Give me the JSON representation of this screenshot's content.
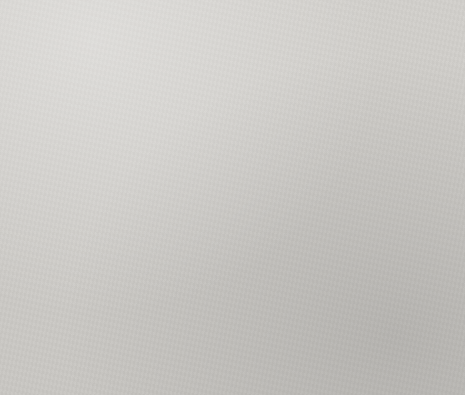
{
  "page": {
    "background": "#cfcdc9",
    "layout": "2x2 grid of pie charts on a scanned grey page"
  },
  "palette": {
    "slice1": "#6e6e6e",
    "slice2": "#4a4a4a",
    "slice3": "#8f8f8f",
    "slice4": "#b9b9b9",
    "slice5": "#d6d6d6",
    "separator": "#dddbd6",
    "text": "#1f1f1f"
  },
  "charts": [
    {
      "id": "alejandro-guillier",
      "title": "Origin of messages of Alejandro Guillier",
      "subtitle": "From 2017-09-15 17:00:00 to 2017-09-15 22:59:59",
      "chart_data": {
        "type": "pie",
        "title": "Origin of messages of Alejandro Guillier",
        "subtitle": "From 2017-09-15 17:00:00 to 2017-09-15 22:59:59",
        "categories": [
          "Twitter for Android",
          "Twitter for iPhone",
          "Twitter Web Client",
          "Facebook",
          "Top Ranking App User Cl."
        ],
        "values": [
          38,
          20,
          4,
          4,
          4
        ],
        "percents": [
          "54.3%",
          "28.6%",
          "5.71%",
          "5.71%",
          "5.71%"
        ],
        "legend_position": "right",
        "total": 70
      },
      "labels": [
        {
          "value": "38",
          "percent": "54.3%"
        },
        {
          "value": "20",
          "percent": "28.6%"
        },
        {
          "value": "4",
          "percent": "5.71%"
        },
        {
          "value": "4",
          "percent": "5.71%"
        },
        {
          "value": "4",
          "percent": "5.71%"
        }
      ],
      "legend": [
        "Twitter for Android",
        "Twitter for iPhone",
        "Twitter Web Client",
        "Facebook",
        "Top Ranking App User Cl."
      ]
    },
    {
      "id": "jose-antonio-kast",
      "title": "Origin of messages of Jose Antonio Kast",
      "subtitle": "From 2017-09-15 17:00:00 to 2017-09-15 22:59:59",
      "chart_data": {
        "type": "pie",
        "title": "Origin of messages of Jose Antonio Kast",
        "subtitle": "From 2017-09-15 17:00:00 to 2017-09-15 22:59:59",
        "categories": [
          "Twitter for Android",
          "Twitter for iPhone",
          "Twitter Web Client",
          "Twitter for iPad",
          "Twitter Lite"
        ],
        "values": [
          831,
          390,
          165,
          57,
          40
        ],
        "percents": [
          "55.7%",
          "26.7%",
          "11.1%",
          "3.82%",
          "2.68%"
        ],
        "legend_position": "right",
        "total": 1483
      },
      "labels": [
        {
          "value": "831",
          "percent": "55.7%"
        },
        {
          "value": "390",
          "percent": "26.7%"
        },
        {
          "value": "165",
          "percent": "11.1%"
        },
        {
          "value": "57",
          "percent": "3.82%"
        },
        {
          "value": "40",
          "percent": "2.68%"
        }
      ],
      "legend": [
        "Twitter for Android",
        "Twitter for iPhone",
        "Twitter Web Client",
        "Twitter for iPad",
        "Twitter Lite"
      ]
    },
    {
      "id": "carolina-goic",
      "title": "Origin of messages of Carolina Goic",
      "subtitle": "From 2017-09-15 17:00:00 to 2017-09-15 22:59:59",
      "chart_data": {
        "type": "pie",
        "title": "Origin of messages of Carolina Goic",
        "subtitle": "From 2017-09-15 17:00:00 to 2017-09-15 22:59:59",
        "categories": [
          "Twitter for Android",
          "Twitter for iPhone",
          "Twitter Web Client",
          "Twitter Lite",
          "Twitter for iPad"
        ],
        "values": [
          130,
          66,
          39,
          18,
          5
        ],
        "percents": [
          "50.4%",
          "25.6%",
          "15.1%",
          "6.98%",
          "1.94%"
        ],
        "legend_position": "right",
        "total": 258
      },
      "labels": [
        {
          "value": "130",
          "percent": "50.4%"
        },
        {
          "value": "66",
          "percent": "25.6%"
        },
        {
          "value": "39",
          "percent": "15.1%"
        },
        {
          "value": "18",
          "percent": "6.98%"
        },
        {
          "value": "5",
          "percent": "1.94%"
        }
      ],
      "legend": [
        "Twitter for Android",
        "Twitter for iPhone",
        "Twitter Web Client",
        "Twitter Lite",
        "Twitter for iPad"
      ]
    },
    {
      "id": "beatriz-sanchez",
      "title": "Origin of messages of Beatriz Sanchez",
      "subtitle": "From 2017-09-15 17:00:00 to 2017-09-15 22:59:59",
      "chart_data": {
        "type": "pie",
        "title": "Origin of messages of Beatriz Sanchez",
        "subtitle": "From 2017-09-15 17:00:00 to 2017-09-15 22:59:59",
        "categories": [
          "Twitter for Android",
          "Twitter for iPhone",
          "Twitter Web Client",
          "Twitter Lite",
          "dlvr"
        ],
        "values": [
          392,
          174,
          104,
          14,
          12
        ],
        "percents": [
          "56.3%",
          "25%",
          "14.9%",
          "2.01%",
          "1.72%"
        ],
        "legend_position": "right",
        "total": 696
      },
      "labels": [
        {
          "value": "392",
          "percent": "56.3%"
        },
        {
          "value": "174",
          "percent": "25%"
        },
        {
          "value": "104",
          "percent": "14.9%"
        },
        {
          "value": "14",
          "percent": "2.01%"
        },
        {
          "value": "12",
          "percent": "1.72%"
        }
      ],
      "legend": [
        "Twitter for Android",
        "Twitter for iPhone",
        "Twitter Web Client",
        "Twitter Lite",
        "dlvr"
      ]
    }
  ]
}
